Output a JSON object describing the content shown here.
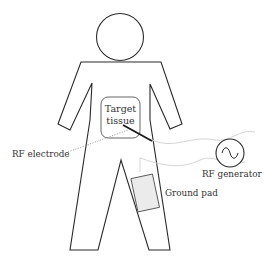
{
  "diagram": {
    "labels": {
      "target_tissue_line1": "Target",
      "target_tissue_line2": "tissue",
      "rf_electrode": "RF electrode",
      "rf_generator": "RF generator",
      "ground_pad": "Ground pad"
    },
    "icons": {
      "generator_symbol": "sine-wave-in-circle"
    },
    "colors": {
      "outline": "#2a2a2a",
      "wire": "#c8c8c8",
      "pad_fill": "#ebebeb",
      "text": "#333333"
    }
  }
}
